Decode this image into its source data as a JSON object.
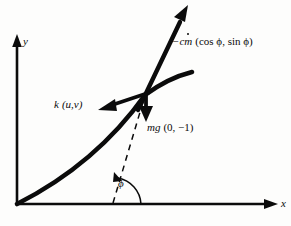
{
  "figure": {
    "background_color": "#fdfdfc",
    "ink_color": "#0b0b0b"
  },
  "axes": {
    "x_label": "x",
    "y_label": "y",
    "origin": {
      "x": 17,
      "y": 204
    },
    "x_arrow_tip": {
      "x": 277,
      "y": 204
    },
    "y_arrow_tip": {
      "x": 14,
      "y": 38
    }
  },
  "trajectory": {
    "name": "flight-path-curve",
    "start": {
      "x": 17,
      "y": 204
    },
    "end": {
      "x": 192,
      "y": 72
    },
    "through": {
      "x": 145,
      "y": 95
    }
  },
  "angle": {
    "symbol": "ϕ",
    "vertex": {
      "x": 113,
      "y": 204
    },
    "arc_radius": 26
  },
  "dashed_line": {
    "from": {
      "x": 113,
      "y": 204
    },
    "to": {
      "x": 146,
      "y": 93
    }
  },
  "vectors": [
    {
      "name": "thrust-vector",
      "label_parts": {
        "prefix": "−c",
        "mdot": "m",
        "components": "(cos ϕ, sin ϕ)"
      },
      "label_full": "−cṁ (cos ϕ, sin ϕ)",
      "tail": {
        "x": 138,
        "y": 110
      },
      "tip": {
        "x": 188,
        "y": 7
      }
    },
    {
      "name": "drag-vector",
      "label_parts": {
        "coefficient": "k",
        "components": "(u,v)"
      },
      "label_full": "k (u,v)",
      "tail": {
        "x": 146,
        "y": 94
      },
      "tip": {
        "x": 99,
        "y": 109
      }
    },
    {
      "name": "weight-vector",
      "label_parts": {
        "coefficient": "mg",
        "components": "(0, −1)"
      },
      "label_full": "mg (0, −1)",
      "tail": {
        "x": 146,
        "y": 94
      },
      "tip": {
        "x": 146,
        "y": 121
      }
    }
  ]
}
